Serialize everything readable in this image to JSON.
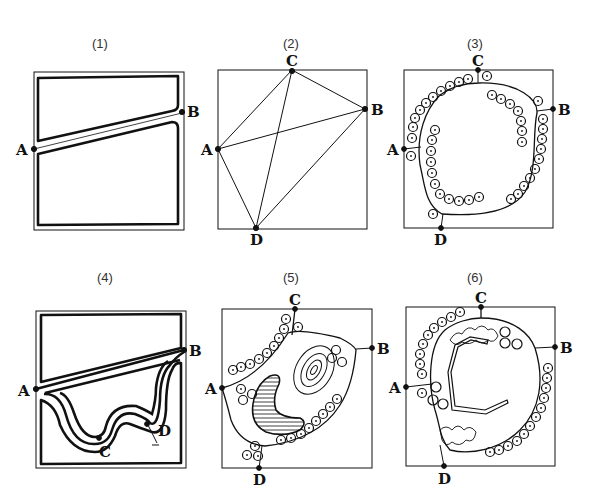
{
  "figure": {
    "panels": [
      {
        "id": "1",
        "label": "(1)",
        "points": [
          "A",
          "B"
        ]
      },
      {
        "id": "2",
        "label": "(2)",
        "points": [
          "A",
          "B",
          "C",
          "D"
        ]
      },
      {
        "id": "3",
        "label": "(3)",
        "points": [
          "A",
          "B",
          "C",
          "D"
        ]
      },
      {
        "id": "4",
        "label": "(4)",
        "points": [
          "A",
          "B",
          "C",
          "D"
        ]
      },
      {
        "id": "5",
        "label": "(5)",
        "points": [
          "A",
          "B",
          "C",
          "D"
        ]
      },
      {
        "id": "6",
        "label": "(6)",
        "points": [
          "A",
          "B",
          "C",
          "D"
        ]
      }
    ],
    "point_labels": {
      "A": "A",
      "B": "B",
      "C": "C",
      "D": "D"
    },
    "colors": {
      "ink": "#111111",
      "background": "#ffffff"
    }
  }
}
